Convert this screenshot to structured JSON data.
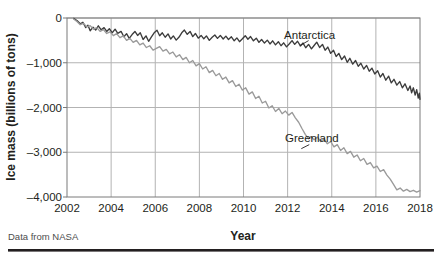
{
  "chart_data": {
    "type": "line",
    "title": "",
    "xlabel": "Year",
    "ylabel": "Ice mass (billions of tons)",
    "xlim": [
      2002,
      2018
    ],
    "ylim": [
      -4000,
      0
    ],
    "xticks": [
      "2002",
      "2004",
      "2006",
      "2008",
      "2010",
      "2012",
      "2014",
      "2016",
      "2018"
    ],
    "yticks": [
      "0",
      "–1,000",
      "–2,000",
      "–3,000",
      "–4,000"
    ],
    "ytick_values": [
      0,
      -1000,
      -2000,
      -3000,
      -4000
    ],
    "xtick_values": [
      2002,
      2004,
      2006,
      2008,
      2010,
      2012,
      2014,
      2016,
      2018
    ],
    "grid": true,
    "legend_position": "inline-annotations",
    "source_note": "Data from NASA",
    "series": [
      {
        "name": "Antarctica",
        "color": "#3c3c3c",
        "label_x": 2013.0,
        "label_y": -470,
        "points": [
          [
            2002.3,
            -10
          ],
          [
            2002.45,
            -55
          ],
          [
            2002.6,
            -130
          ],
          [
            2002.72,
            -95
          ],
          [
            2002.85,
            -215
          ],
          [
            2002.95,
            -160
          ],
          [
            2003.05,
            -285
          ],
          [
            2003.18,
            -205
          ],
          [
            2003.3,
            -270
          ],
          [
            2003.42,
            -175
          ],
          [
            2003.55,
            -265
          ],
          [
            2003.68,
            -215
          ],
          [
            2003.8,
            -300
          ],
          [
            2003.92,
            -240
          ],
          [
            2004.05,
            -330
          ],
          [
            2004.18,
            -250
          ],
          [
            2004.3,
            -345
          ],
          [
            2004.45,
            -300
          ],
          [
            2004.58,
            -420
          ],
          [
            2004.7,
            -350
          ],
          [
            2004.82,
            -455
          ],
          [
            2004.95,
            -370
          ],
          [
            2005.08,
            -300
          ],
          [
            2005.2,
            -390
          ],
          [
            2005.32,
            -330
          ],
          [
            2005.45,
            -480
          ],
          [
            2005.58,
            -400
          ],
          [
            2005.7,
            -520
          ],
          [
            2005.82,
            -430
          ],
          [
            2005.95,
            -330
          ],
          [
            2006.08,
            -275
          ],
          [
            2006.2,
            -395
          ],
          [
            2006.32,
            -330
          ],
          [
            2006.45,
            -430
          ],
          [
            2006.58,
            -355
          ],
          [
            2006.7,
            -470
          ],
          [
            2006.82,
            -400
          ],
          [
            2006.95,
            -495
          ],
          [
            2007.08,
            -425
          ],
          [
            2007.2,
            -330
          ],
          [
            2007.32,
            -270
          ],
          [
            2007.45,
            -365
          ],
          [
            2007.58,
            -300
          ],
          [
            2007.7,
            -415
          ],
          [
            2007.82,
            -345
          ],
          [
            2007.95,
            -450
          ],
          [
            2008.08,
            -390
          ],
          [
            2008.2,
            -465
          ],
          [
            2008.32,
            -400
          ],
          [
            2008.45,
            -500
          ],
          [
            2008.58,
            -430
          ],
          [
            2008.7,
            -380
          ],
          [
            2008.82,
            -455
          ],
          [
            2008.95,
            -390
          ],
          [
            2009.08,
            -470
          ],
          [
            2009.2,
            -405
          ],
          [
            2009.32,
            -480
          ],
          [
            2009.45,
            -420
          ],
          [
            2009.58,
            -510
          ],
          [
            2009.7,
            -445
          ],
          [
            2009.82,
            -530
          ],
          [
            2009.95,
            -465
          ],
          [
            2010.08,
            -395
          ],
          [
            2010.2,
            -475
          ],
          [
            2010.32,
            -415
          ],
          [
            2010.45,
            -510
          ],
          [
            2010.58,
            -450
          ],
          [
            2010.7,
            -545
          ],
          [
            2010.82,
            -480
          ],
          [
            2010.95,
            -560
          ],
          [
            2011.08,
            -495
          ],
          [
            2011.2,
            -580
          ],
          [
            2011.32,
            -510
          ],
          [
            2011.45,
            -600
          ],
          [
            2011.58,
            -530
          ],
          [
            2011.7,
            -620
          ],
          [
            2011.82,
            -555
          ],
          [
            2011.95,
            -645
          ],
          [
            2012.08,
            -575
          ],
          [
            2012.2,
            -505
          ],
          [
            2012.32,
            -590
          ],
          [
            2012.45,
            -520
          ],
          [
            2012.58,
            -625
          ],
          [
            2012.7,
            -560
          ],
          [
            2012.82,
            -665
          ],
          [
            2012.95,
            -590
          ],
          [
            2013.08,
            -690
          ],
          [
            2013.2,
            -615
          ],
          [
            2013.32,
            -540
          ],
          [
            2013.45,
            -660
          ],
          [
            2013.58,
            -590
          ],
          [
            2013.7,
            -720
          ],
          [
            2013.82,
            -650
          ],
          [
            2013.95,
            -790
          ],
          [
            2014.08,
            -720
          ],
          [
            2014.2,
            -860
          ],
          [
            2014.32,
            -790
          ],
          [
            2014.45,
            -930
          ],
          [
            2014.58,
            -850
          ],
          [
            2014.7,
            -990
          ],
          [
            2014.82,
            -900
          ],
          [
            2014.95,
            -1030
          ],
          [
            2015.08,
            -950
          ],
          [
            2015.2,
            -1080
          ],
          [
            2015.32,
            -1010
          ],
          [
            2015.45,
            -1140
          ],
          [
            2015.58,
            -1060
          ],
          [
            2015.7,
            -1190
          ],
          [
            2015.82,
            -1120
          ],
          [
            2015.95,
            -1250
          ],
          [
            2016.08,
            -1180
          ],
          [
            2016.2,
            -1320
          ],
          [
            2016.32,
            -1240
          ],
          [
            2016.45,
            -1390
          ],
          [
            2016.58,
            -1300
          ],
          [
            2016.7,
            -1450
          ],
          [
            2016.82,
            -1370
          ],
          [
            2016.95,
            -1500
          ],
          [
            2017.08,
            -1420
          ],
          [
            2017.2,
            -1560
          ],
          [
            2017.32,
            -1470
          ],
          [
            2017.45,
            -1620
          ],
          [
            2017.55,
            -1520
          ],
          [
            2017.62,
            -1670
          ],
          [
            2017.7,
            -1560
          ],
          [
            2017.78,
            -1720
          ],
          [
            2017.85,
            -1600
          ],
          [
            2017.92,
            -1790
          ],
          [
            2017.97,
            -1680
          ],
          [
            2018.0,
            -1820
          ]
        ]
      },
      {
        "name": "Greenland",
        "color": "#9a9a9a",
        "label_x": 2013.1,
        "label_y": -2770,
        "points": [
          [
            2002.3,
            -20
          ],
          [
            2002.45,
            -80
          ],
          [
            2002.6,
            -150
          ],
          [
            2002.75,
            -120
          ],
          [
            2002.9,
            -200
          ],
          [
            2003.05,
            -170
          ],
          [
            2003.2,
            -250
          ],
          [
            2003.35,
            -215
          ],
          [
            2003.5,
            -300
          ],
          [
            2003.65,
            -260
          ],
          [
            2003.8,
            -345
          ],
          [
            2003.95,
            -310
          ],
          [
            2004.1,
            -395
          ],
          [
            2004.25,
            -350
          ],
          [
            2004.4,
            -440
          ],
          [
            2004.55,
            -400
          ],
          [
            2004.7,
            -500
          ],
          [
            2004.85,
            -455
          ],
          [
            2005.0,
            -545
          ],
          [
            2005.15,
            -500
          ],
          [
            2005.3,
            -600
          ],
          [
            2005.45,
            -560
          ],
          [
            2005.6,
            -660
          ],
          [
            2005.75,
            -620
          ],
          [
            2005.9,
            -720
          ],
          [
            2006.05,
            -680
          ],
          [
            2006.2,
            -640
          ],
          [
            2006.35,
            -740
          ],
          [
            2006.5,
            -700
          ],
          [
            2006.65,
            -800
          ],
          [
            2006.8,
            -760
          ],
          [
            2006.95,
            -870
          ],
          [
            2007.1,
            -820
          ],
          [
            2007.25,
            -930
          ],
          [
            2007.4,
            -880
          ],
          [
            2007.55,
            -1000
          ],
          [
            2007.7,
            -950
          ],
          [
            2007.85,
            -1070
          ],
          [
            2008.0,
            -1020
          ],
          [
            2008.15,
            -1140
          ],
          [
            2008.3,
            -1090
          ],
          [
            2008.45,
            -1220
          ],
          [
            2008.6,
            -1170
          ],
          [
            2008.75,
            -1290
          ],
          [
            2008.9,
            -1240
          ],
          [
            2009.05,
            -1370
          ],
          [
            2009.2,
            -1320
          ],
          [
            2009.35,
            -1450
          ],
          [
            2009.5,
            -1400
          ],
          [
            2009.65,
            -1530
          ],
          [
            2009.8,
            -1480
          ],
          [
            2009.95,
            -1610
          ],
          [
            2010.1,
            -1560
          ],
          [
            2010.25,
            -1700
          ],
          [
            2010.4,
            -1650
          ],
          [
            2010.55,
            -1800
          ],
          [
            2010.7,
            -1750
          ],
          [
            2010.85,
            -1900
          ],
          [
            2011.0,
            -1860
          ],
          [
            2011.15,
            -2010
          ],
          [
            2011.3,
            -1960
          ],
          [
            2011.45,
            -2090
          ],
          [
            2011.6,
            -2020
          ],
          [
            2011.75,
            -2140
          ],
          [
            2011.9,
            -2080
          ],
          [
            2012.05,
            -2170
          ],
          [
            2012.2,
            -2110
          ],
          [
            2012.35,
            -2230
          ],
          [
            2012.5,
            -2330
          ],
          [
            2012.65,
            -2470
          ],
          [
            2012.8,
            -2600
          ],
          [
            2012.95,
            -2700
          ],
          [
            2013.05,
            -2650
          ],
          [
            2013.2,
            -2720
          ],
          [
            2013.35,
            -2660
          ],
          [
            2013.5,
            -2760
          ],
          [
            2013.65,
            -2700
          ],
          [
            2013.8,
            -2810
          ],
          [
            2013.95,
            -2760
          ],
          [
            2014.1,
            -2880
          ],
          [
            2014.25,
            -2830
          ],
          [
            2014.4,
            -2960
          ],
          [
            2014.55,
            -2900
          ],
          [
            2014.7,
            -3030
          ],
          [
            2014.85,
            -2980
          ],
          [
            2015.0,
            -3110
          ],
          [
            2015.15,
            -3060
          ],
          [
            2015.3,
            -3190
          ],
          [
            2015.45,
            -3140
          ],
          [
            2015.6,
            -3270
          ],
          [
            2015.75,
            -3230
          ],
          [
            2015.9,
            -3350
          ],
          [
            2016.05,
            -3310
          ],
          [
            2016.2,
            -3430
          ],
          [
            2016.35,
            -3390
          ],
          [
            2016.5,
            -3510
          ],
          [
            2016.65,
            -3600
          ],
          [
            2016.8,
            -3720
          ],
          [
            2016.95,
            -3840
          ],
          [
            2017.1,
            -3800
          ],
          [
            2017.25,
            -3870
          ],
          [
            2017.4,
            -3830
          ],
          [
            2017.55,
            -3880
          ],
          [
            2017.7,
            -3850
          ],
          [
            2017.85,
            -3890
          ],
          [
            2018.0,
            -3860
          ]
        ]
      }
    ]
  },
  "axes": {
    "x_title": "Year",
    "y_title": "Ice mass (billions of tons)"
  },
  "footer": {
    "source": "Data from NASA"
  }
}
